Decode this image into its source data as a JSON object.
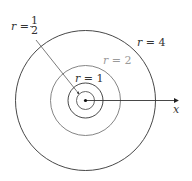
{
  "diagram": {
    "center": {
      "x": 85.5,
      "y": 100.5
    },
    "axis": {
      "label": "x"
    },
    "circles": [
      {
        "name": "r-half",
        "r": 9,
        "label_lhs": "r =",
        "label_num": "1",
        "label_den": "2",
        "color": "#333333"
      },
      {
        "name": "r-1",
        "r": 17.5,
        "label": "r = 1",
        "color": "#333333"
      },
      {
        "name": "r-2",
        "r": 35,
        "label": "r = 2",
        "color": "#9a9a9a"
      },
      {
        "name": "r-4",
        "r": 70,
        "label": "r = 4",
        "color": "#333333"
      }
    ]
  }
}
